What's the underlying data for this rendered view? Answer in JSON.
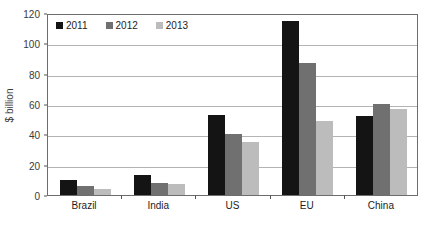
{
  "chart_data": {
    "type": "bar",
    "title": "",
    "subtitle": "",
    "xlabel": "",
    "ylabel": "$ billion",
    "categories": [
      "Brazil",
      "India",
      "US",
      "EU",
      "China"
    ],
    "series": [
      {
        "name": "2011",
        "color": "#141414",
        "values": [
          10,
          13,
          53,
          115,
          52
        ]
      },
      {
        "name": "2012",
        "color": "#707070",
        "values": [
          6,
          8,
          40,
          87,
          60
        ]
      },
      {
        "name": "2013",
        "color": "#bcbcbc",
        "values": [
          4,
          7,
          35,
          49,
          57
        ]
      }
    ],
    "ylim": [
      0,
      120
    ],
    "yticks": [
      0,
      20,
      40,
      60,
      80,
      100,
      120
    ],
    "ytick_labels": [
      "0",
      "20",
      "40",
      "60",
      "80",
      "100",
      "120"
    ],
    "grid": true,
    "grid_axis": "y",
    "legend_position": "top-left",
    "plot_border": true,
    "plot_border_color": "#6d6d6d",
    "gridline_color": "#b4b4b4",
    "background_color": "#ffffff"
  }
}
